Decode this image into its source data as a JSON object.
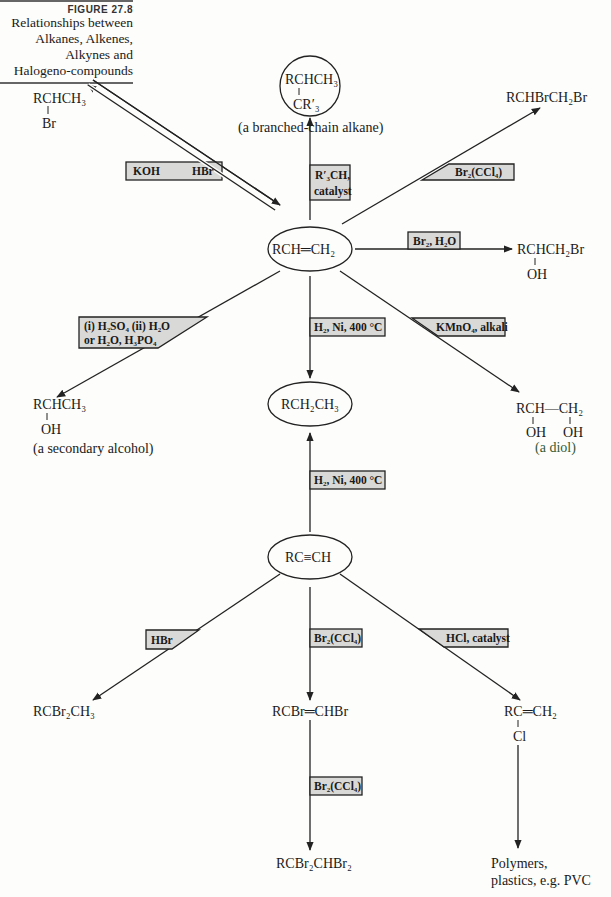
{
  "caption": {
    "figure_number": "FIGURE 27.8",
    "title_lines": [
      "Relationships between",
      "Alkanes, Alkenes,",
      "Alkynes and",
      "Halogeno-compounds"
    ]
  },
  "nodes": {
    "alkene": "RCH═CH₂",
    "alkane": "RCH₂CH₃",
    "alkyne": "RC≡CH",
    "bromoalkane": {
      "main": "RCHCH₃",
      "branch": "Br"
    },
    "branched_alkane": {
      "main": "RCHCH₃",
      "branch": "CR′₃",
      "label": "(a branched-chain alkane)"
    },
    "dibromide": "RCHBrCH₂Br",
    "bromohydrin": {
      "main": "RCHCH₂Br",
      "branch": "OH"
    },
    "secondary_alcohol": {
      "main": "RCHCH₃",
      "branch": "OH",
      "label": "(a secondary alcohol)"
    },
    "diol": {
      "main": "RCH—CH₂",
      "branch_left": "OH",
      "branch_right": "OH",
      "label": "(a diol)"
    },
    "gem_dibromide": "RCBr₂CH₃",
    "dibromoalkene": "RCBr═CHBr",
    "tetrabromide": "RCBr₂CHBr₂",
    "vinyl_chloride": {
      "main": "RC═CH₂",
      "branch": "Cl"
    },
    "polymers": [
      "Polymers,",
      "plastics, e.g. PVC"
    ]
  },
  "reagents": {
    "koh": "KOH",
    "hbr_upper": "HBr",
    "r3ch_line1": "R′₃CH,",
    "r3ch_line2": "catalyst",
    "br2_ccl4_upper": "Br₂(CCl₄)",
    "br2_h2o": "Br₂, H₂O",
    "h2so4_line1": "(i) H₂SO₄  (ii) H₂O",
    "h2so4_line2": "or H₂O, H₃PO₄",
    "h2_ni_upper": "H₂, Ni, 400 °C",
    "kmno4": "KMnO₄, alkali",
    "h2_ni_lower": "H₂, Ni, 400 °C",
    "hbr_lower": "HBr",
    "br2_ccl4_mid": "Br₂(CCl₄)",
    "hcl": "HCl, catalyst",
    "br2_ccl4_lower": "Br₂(CCl₄)"
  },
  "colors": {
    "box_fill": "#d9d9d7",
    "line": "#222222",
    "background": "#fdfdfb"
  }
}
